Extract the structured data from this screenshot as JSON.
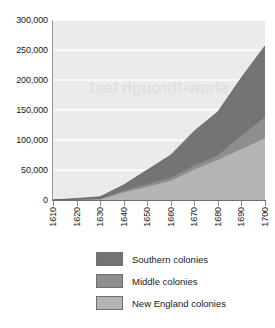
{
  "chart_data": {
    "type": "area",
    "stacked": true,
    "title": "",
    "subtitle": "",
    "xlabel": "",
    "ylabel": "",
    "x": [
      1610,
      1620,
      1630,
      1640,
      1650,
      1660,
      1670,
      1680,
      1690,
      1700
    ],
    "xtick_labels": [
      "1610",
      "1620",
      "1630",
      "1640",
      "1650",
      "1660",
      "1670",
      "1680",
      "1690",
      "1700"
    ],
    "ytick_labels": [
      "0",
      "50,000",
      "100,000",
      "150,000",
      "200,000",
      "250,000",
      "300,000"
    ],
    "ytick_values": [
      0,
      50000,
      100000,
      150000,
      200000,
      250000,
      300000
    ],
    "xlim": [
      1610,
      1700
    ],
    "ylim": [
      0,
      300000
    ],
    "grid": true,
    "grid_axis": "y",
    "legend_position": "bottom",
    "stack_order_bottom_to_top": [
      "New England colonies",
      "Middle colonies",
      "Southern colonies"
    ],
    "series": [
      {
        "name": "New England colonies",
        "color": "#b4b4b4",
        "values": [
          0,
          1000,
          2000,
          14000,
          23000,
          33000,
          52000,
          68000,
          86000,
          104000
        ]
      },
      {
        "name": "Middle colonies",
        "color": "#8e8e8e",
        "values": [
          0,
          500,
          500,
          2000,
          4000,
          5000,
          6000,
          7000,
          22000,
          35000
        ]
      },
      {
        "name": "Southern colonies",
        "color": "#747474",
        "values": [
          0,
          1000,
          3000,
          9000,
          23000,
          37000,
          57000,
          72000,
          96000,
          118000
        ]
      }
    ],
    "series_totals": [
      0,
      2500,
      5500,
      25000,
      50000,
      75000,
      115000,
      147000,
      204000,
      257000
    ]
  },
  "legend": {
    "items": [
      {
        "label": "Southern colonies",
        "color": "#747474"
      },
      {
        "label": "Middle colonies",
        "color": "#8e8e8e"
      },
      {
        "label": "New England colonies",
        "color": "#b4b4b4"
      }
    ]
  },
  "watermark": {
    "text": "show-through text"
  },
  "style": {
    "plot_background": "#ebebeb",
    "gridline_color": "#ffffff",
    "axis_color": "#6e6e6e"
  }
}
